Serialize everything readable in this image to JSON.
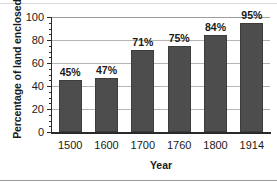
{
  "chart_data": {
    "type": "bar",
    "title": "",
    "xlabel": "Year",
    "ylabel": "Percentage of land enclosed",
    "categories": [
      "1500",
      "1600",
      "1700",
      "1760",
      "1800",
      "1914"
    ],
    "values": [
      45,
      47,
      71,
      75,
      84,
      95
    ],
    "data_labels": [
      "45%",
      "47%",
      "71%",
      "75%",
      "84%",
      "95%"
    ],
    "ylim": [
      0,
      100
    ],
    "yticks": [
      0,
      20,
      40,
      60,
      80,
      100
    ],
    "ytick_labels": [
      "0",
      "20",
      "40",
      "60",
      "80",
      "100"
    ],
    "minor_tick_step": 5,
    "grid": "horizontal",
    "legend": "none",
    "bar_color": "#4d4d4d",
    "gridline_color": "#b5b5b5",
    "axis_color": "#2a2a2a",
    "text_color": "#1a1a1a",
    "background": "#ffffff"
  }
}
